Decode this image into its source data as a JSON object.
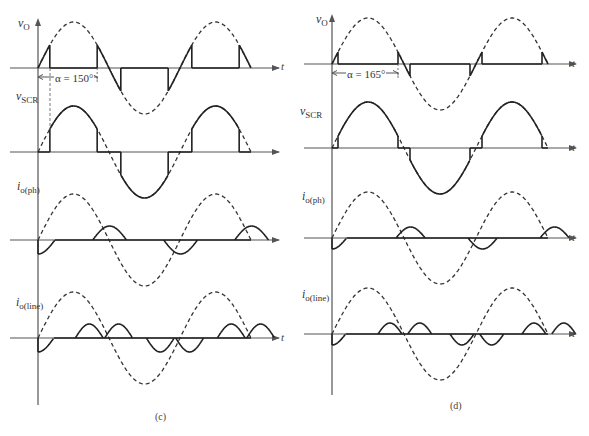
{
  "figure": {
    "panels": [
      {
        "id": "c",
        "caption": "(c)",
        "firing_angle_label": "α = 150°",
        "firing_angle_deg": 150,
        "axis_x": 38,
        "period_px": 142,
        "t_label": "t",
        "plots": [
          {
            "name": "vO",
            "label_main": "v",
            "label_sub": "O",
            "axis_y": 68,
            "amp": 46
          },
          {
            "name": "vSCR",
            "label_main": "v",
            "label_sub": "SCR",
            "axis_y": 152,
            "amp": 46
          },
          {
            "name": "io_ph",
            "label_main": "i",
            "label_sub": "o(ph)",
            "axis_y": 240,
            "amp": 46
          },
          {
            "name": "io_line",
            "label_main": "i",
            "label_sub": "o(line)",
            "axis_y": 338,
            "amp": 46
          }
        ]
      },
      {
        "id": "d",
        "caption": "(d)",
        "firing_angle_label": "α = 165°",
        "firing_angle_deg": 165,
        "axis_x": 332,
        "period_px": 144,
        "t_label": "t",
        "plots": [
          {
            "name": "vO",
            "label_main": "v",
            "label_sub": "O",
            "axis_y": 64,
            "amp": 46
          },
          {
            "name": "vSCR",
            "label_main": "v",
            "label_sub": "SCR",
            "axis_y": 148,
            "amp": 46
          },
          {
            "name": "io_ph",
            "label_main": "i",
            "label_sub": "o(ph)",
            "axis_y": 238,
            "amp": 46
          },
          {
            "name": "io_line",
            "label_main": "i",
            "label_sub": "o(line)",
            "axis_y": 334,
            "amp": 46
          }
        ]
      }
    ],
    "colors": {
      "line": "#222222",
      "dashed": "#333333",
      "axis": "#555555"
    }
  }
}
